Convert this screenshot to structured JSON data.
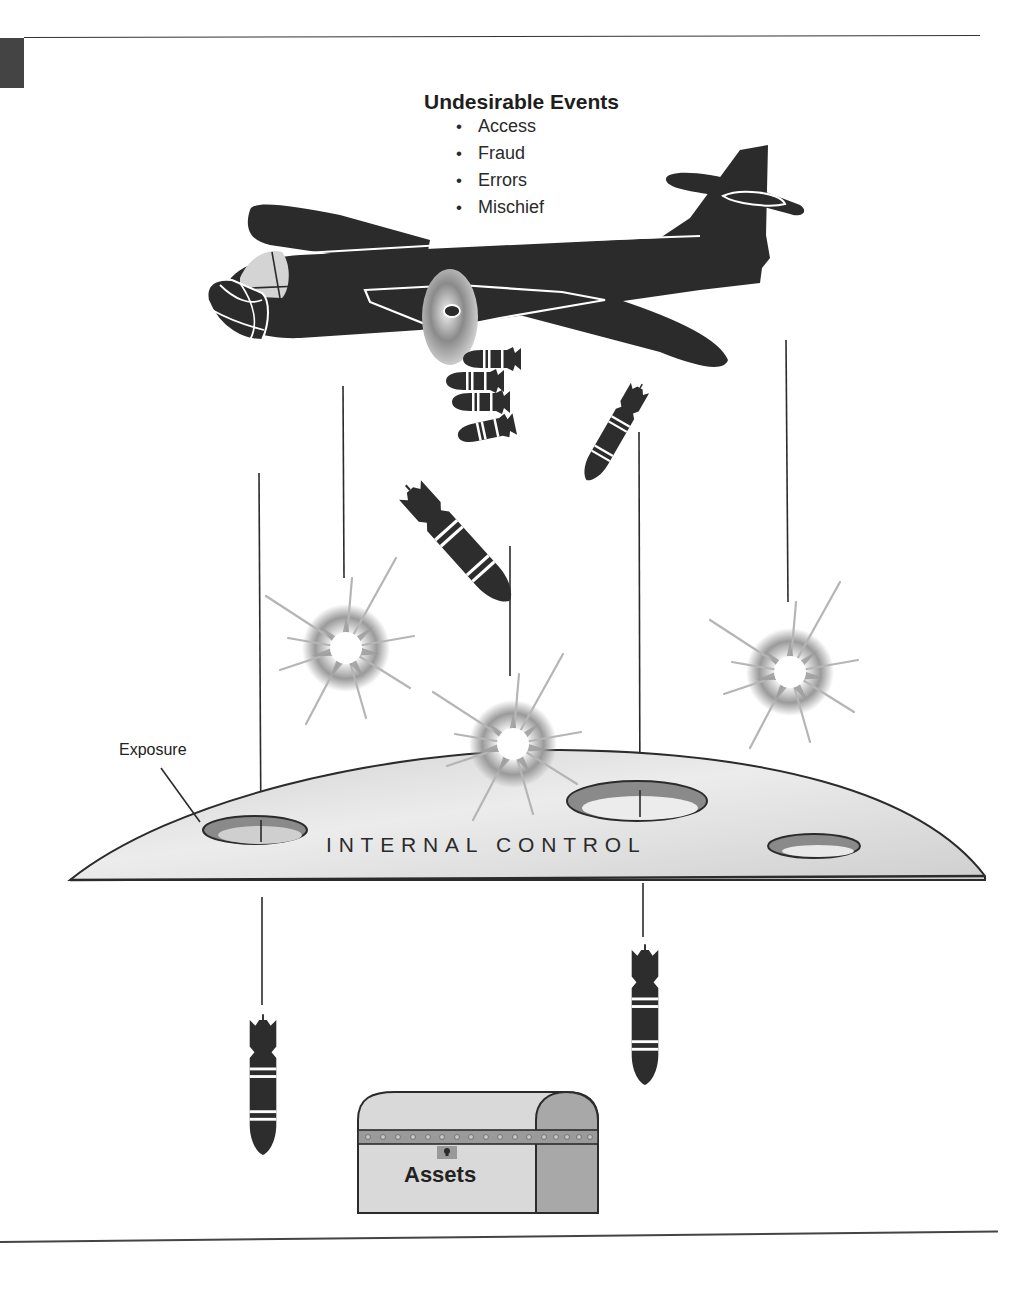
{
  "diagram": {
    "title": "Undesirable Events",
    "events": [
      "Access",
      "Fraud",
      "Errors",
      "Mischief"
    ],
    "barrier_label": "INTERNAL CONTROL",
    "exposure_label": "Exposure",
    "protected_label": "Assets"
  },
  "colors": {
    "ink": "#2b2b2b",
    "dome_fill": "#d6d6d6",
    "hole_fill": "#8a8a8a",
    "chest_front": "#d9d9d9",
    "chest_side": "#a8a8a8",
    "chest_band": "#9a9a9a"
  }
}
